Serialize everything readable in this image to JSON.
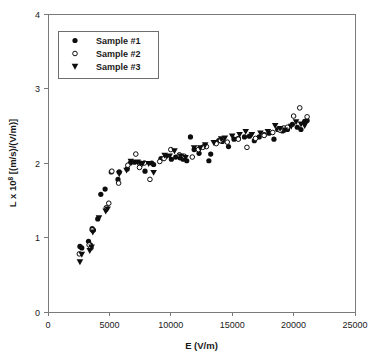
{
  "chart_data": {
    "type": "scatter",
    "title": "",
    "xlabel": "E (V/m)",
    "ylabel_prefix": "L x 10",
    "ylabel_exponent": "8",
    "ylabel_suffix": " [(m/s)/(V/m)]",
    "ylabel_full": "L x 10^8 [(m/s)/(V/m)]",
    "xlim": [
      0,
      25000
    ],
    "ylim": [
      0,
      4
    ],
    "xticks": [
      0,
      5000,
      10000,
      15000,
      20000,
      25000
    ],
    "yticks": [
      0,
      1,
      2,
      3,
      4
    ],
    "xticklabels": [
      "0",
      "5000",
      "10000",
      "15000",
      "20000",
      "25000"
    ],
    "yticklabels": [
      "0",
      "1",
      "2",
      "3",
      "4"
    ],
    "grid": false,
    "legend_position": "upper-left",
    "marker_color": "#0d0d0d",
    "axis_color": "#7a7a7a",
    "series": [
      {
        "name": "Sample #1",
        "marker": "filled-circle",
        "points": [
          [
            2600,
            0.88
          ],
          [
            2750,
            0.86
          ],
          [
            3300,
            0.95
          ],
          [
            3450,
            0.9
          ],
          [
            3600,
            1.12
          ],
          [
            3700,
            1.1
          ],
          [
            4050,
            1.25
          ],
          [
            4300,
            1.58
          ],
          [
            4650,
            1.65
          ],
          [
            5150,
            1.88
          ],
          [
            5700,
            1.78
          ],
          [
            5800,
            1.88
          ],
          [
            6450,
            1.92
          ],
          [
            6700,
            2.0
          ],
          [
            7050,
            2.01
          ],
          [
            7550,
            2.0
          ],
          [
            7900,
            1.89
          ],
          [
            8450,
            2.0
          ],
          [
            8600,
            1.98
          ],
          [
            9200,
            2.06
          ],
          [
            9600,
            2.09
          ],
          [
            10050,
            2.05
          ],
          [
            10400,
            2.08
          ],
          [
            10750,
            2.07
          ],
          [
            11000,
            2.05
          ],
          [
            11300,
            2.03
          ],
          [
            11600,
            2.35
          ],
          [
            11900,
            2.18
          ],
          [
            12300,
            2.13
          ],
          [
            12700,
            2.22
          ],
          [
            13100,
            2.03
          ],
          [
            13250,
            2.12
          ],
          [
            13900,
            2.3
          ],
          [
            14200,
            2.29
          ],
          [
            14700,
            2.22
          ],
          [
            15150,
            2.32
          ],
          [
            15500,
            2.33
          ],
          [
            16000,
            2.35
          ],
          [
            16400,
            2.36
          ],
          [
            16800,
            2.3
          ],
          [
            17200,
            2.35
          ],
          [
            17600,
            2.38
          ],
          [
            18000,
            2.4
          ],
          [
            18400,
            2.32
          ],
          [
            18700,
            2.45
          ],
          [
            19100,
            2.43
          ],
          [
            19500,
            2.45
          ],
          [
            19900,
            2.52
          ],
          [
            20300,
            2.48
          ],
          [
            20600,
            2.45
          ],
          [
            20900,
            2.56
          ],
          [
            21100,
            2.57
          ]
        ]
      },
      {
        "name": "Sample #2",
        "marker": "open-circle",
        "points": [
          [
            2550,
            0.78
          ],
          [
            3350,
            0.9
          ],
          [
            3500,
            0.86
          ],
          [
            3600,
            1.1
          ],
          [
            4750,
            1.4
          ],
          [
            4950,
            1.46
          ],
          [
            5200,
            1.89
          ],
          [
            5750,
            1.73
          ],
          [
            6500,
            1.97
          ],
          [
            7150,
            2.12
          ],
          [
            7450,
            1.94
          ],
          [
            7850,
            2.0
          ],
          [
            8300,
            1.78
          ],
          [
            9100,
            2.02
          ],
          [
            9450,
            2.06
          ],
          [
            10000,
            2.18
          ],
          [
            10700,
            2.11
          ],
          [
            11100,
            2.09
          ],
          [
            11750,
            2.08
          ],
          [
            12250,
            2.18
          ],
          [
            12600,
            2.21
          ],
          [
            12900,
            2.22
          ],
          [
            13700,
            2.26
          ],
          [
            14050,
            2.3
          ],
          [
            14600,
            2.28
          ],
          [
            15500,
            2.32
          ],
          [
            16200,
            2.21
          ],
          [
            16900,
            2.33
          ],
          [
            17600,
            2.37
          ],
          [
            18300,
            2.41
          ],
          [
            18900,
            2.44
          ],
          [
            19200,
            2.47
          ],
          [
            19500,
            2.48
          ],
          [
            20000,
            2.63
          ],
          [
            20500,
            2.74
          ],
          [
            21100,
            2.62
          ]
        ]
      },
      {
        "name": "Sample #3",
        "marker": "filled-triangle-down",
        "points": [
          [
            2600,
            0.67
          ],
          [
            2750,
            0.77
          ],
          [
            3400,
            0.82
          ],
          [
            3550,
            0.87
          ],
          [
            3650,
            1.07
          ],
          [
            4150,
            1.26
          ],
          [
            4700,
            1.35
          ],
          [
            4850,
            1.38
          ],
          [
            5800,
            1.85
          ],
          [
            6400,
            1.9
          ],
          [
            6750,
            2.02
          ],
          [
            7300,
            2.01
          ],
          [
            7700,
            1.99
          ],
          [
            8200,
            1.99
          ],
          [
            8600,
            1.87
          ],
          [
            9500,
            2.1
          ],
          [
            9900,
            2.09
          ],
          [
            10300,
            2.16
          ],
          [
            10800,
            2.09
          ],
          [
            11200,
            2.07
          ],
          [
            11900,
            2.2
          ],
          [
            12400,
            2.2
          ],
          [
            12800,
            2.24
          ],
          [
            13500,
            2.27
          ],
          [
            14100,
            2.32
          ],
          [
            14400,
            2.33
          ],
          [
            15000,
            2.36
          ],
          [
            15600,
            2.38
          ],
          [
            16100,
            2.42
          ],
          [
            16600,
            2.38
          ],
          [
            17300,
            2.4
          ],
          [
            17900,
            2.42
          ],
          [
            18500,
            2.5
          ],
          [
            18900,
            2.46
          ],
          [
            19300,
            2.44
          ],
          [
            19800,
            2.49
          ],
          [
            20200,
            2.55
          ],
          [
            20600,
            2.52
          ],
          [
            20900,
            2.5
          ]
        ]
      }
    ]
  },
  "legend": {
    "entries": [
      {
        "label": "Sample #1",
        "marker": "filled-circle"
      },
      {
        "label": "Sample #2",
        "marker": "open-circle"
      },
      {
        "label": "Sample #3",
        "marker": "filled-triangle-down"
      }
    ]
  }
}
